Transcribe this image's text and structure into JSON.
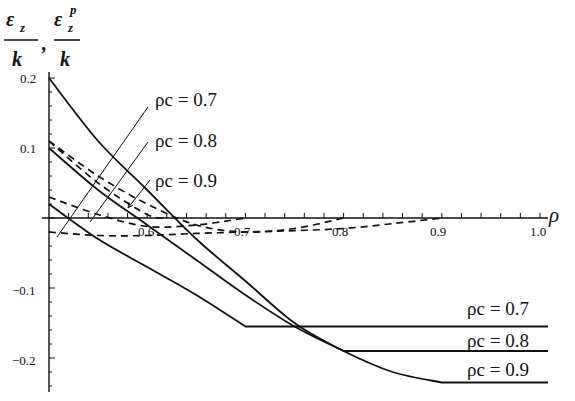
{
  "chart_data": {
    "type": "line",
    "title": "",
    "xlabel": "ρ",
    "ylabel": "ε_z/k, ε_z^p/k",
    "ylabel_parts": {
      "num1": "ε",
      "sub1": "z",
      "den": "k",
      "comma": ",",
      "num2": "ε",
      "sub2": "z",
      "sup2": "p"
    },
    "xlim": [
      0.5,
      1.0
    ],
    "ylim": [
      -0.24,
      0.21
    ],
    "x_ticks": [
      "0.6",
      "0.7",
      "0.8",
      "0.9",
      "1.0"
    ],
    "y_ticks": [
      "0.2",
      "0.1",
      "-0.1",
      "-0.2"
    ],
    "grid": false,
    "legend": "inline annotations",
    "annotations": [
      {
        "text": "ρc = 0.7",
        "position": "upper-left"
      },
      {
        "text": "ρc = 0.8",
        "position": "upper-left"
      },
      {
        "text": "ρc = 0.9",
        "position": "upper-left"
      },
      {
        "text": "ρc = 0.7",
        "position": "lower-right"
      },
      {
        "text": "ρc = 0.8",
        "position": "lower-right"
      },
      {
        "text": "ρc = 0.9",
        "position": "lower-right"
      }
    ],
    "series": [
      {
        "name": "ε_z/k, ρc = 0.7",
        "style": "solid",
        "x": [
          0.5,
          0.55,
          0.6,
          0.65,
          0.7,
          1.0
        ],
        "y": [
          0.02,
          -0.03,
          -0.07,
          -0.11,
          -0.155,
          -0.155
        ]
      },
      {
        "name": "ε_z/k, ρc = 0.8",
        "style": "solid",
        "x": [
          0.5,
          0.55,
          0.6,
          0.65,
          0.7,
          0.75,
          0.8,
          1.0
        ],
        "y": [
          0.1,
          0.04,
          -0.01,
          -0.06,
          -0.11,
          -0.155,
          -0.19,
          -0.19
        ]
      },
      {
        "name": "ε_z/k, ρc = 0.9",
        "style": "solid",
        "x": [
          0.5,
          0.55,
          0.6,
          0.65,
          0.7,
          0.75,
          0.8,
          0.85,
          0.9,
          1.0
        ],
        "y": [
          0.2,
          0.11,
          0.04,
          -0.03,
          -0.09,
          -0.15,
          -0.19,
          -0.22,
          -0.235,
          -0.235
        ]
      },
      {
        "name": "ε_z^p/k, ρc = 0.7",
        "style": "dashed",
        "x": [
          0.5,
          0.55,
          0.6,
          0.65,
          0.7
        ],
        "y": [
          0.03,
          0.005,
          -0.012,
          -0.01,
          0.0
        ]
      },
      {
        "name": "ε_z^p/k, ρc = 0.8",
        "style": "dashed",
        "x": [
          0.5,
          0.55,
          0.6,
          0.65,
          0.7,
          0.75,
          0.8
        ],
        "y": [
          0.11,
          0.06,
          0.02,
          -0.01,
          -0.02,
          -0.015,
          0.0
        ]
      },
      {
        "name": "ε_z^p/k, ρc = 0.9 (lower)",
        "style": "dashed",
        "x": [
          0.5,
          0.55,
          0.6,
          0.65,
          0.7,
          0.75,
          0.8,
          0.85,
          0.9
        ],
        "y": [
          -0.02,
          -0.025,
          -0.025,
          -0.022,
          -0.02,
          -0.018,
          -0.015,
          -0.008,
          0.0
        ]
      },
      {
        "name": "ε_z^p/k, ρc = 0.9 (upper)",
        "style": "dashed",
        "x": [
          0.5,
          0.55,
          0.6,
          0.62
        ],
        "y": [
          0.11,
          0.05,
          0.005,
          0.0
        ]
      }
    ]
  }
}
